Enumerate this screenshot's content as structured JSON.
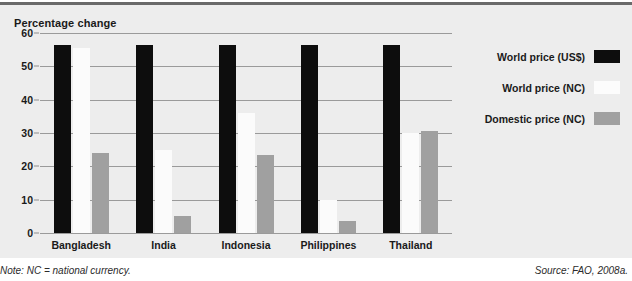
{
  "chart_data": {
    "type": "bar",
    "title": "Percentage change",
    "xlabel": "",
    "ylabel": "",
    "ylim": [
      0,
      60
    ],
    "yticks": [
      0,
      10,
      20,
      30,
      40,
      50,
      60
    ],
    "grid": true,
    "legend_position": "right",
    "categories": [
      "Bangladesh",
      "India",
      "Indonesia",
      "Philippines",
      "Thailand"
    ],
    "series": [
      {
        "name": "World price (US$)",
        "color": "#0d0d0d",
        "values": [
          56.5,
          56.5,
          56.5,
          56.5,
          56.5
        ]
      },
      {
        "name": "World price (NC)",
        "color": "#fbfbfb",
        "values": [
          55.5,
          25.0,
          36.0,
          10.0,
          30.0
        ]
      },
      {
        "name": "Domestic price (NC)",
        "color": "#a0a0a0",
        "values": [
          24.0,
          5.0,
          23.5,
          3.5,
          30.5
        ]
      }
    ],
    "note": "Note: NC = national currency.",
    "source": "Source: FAO, 2008a."
  }
}
